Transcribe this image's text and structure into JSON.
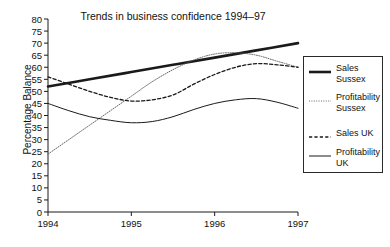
{
  "chart_data": {
    "type": "line",
    "title": "Trends in business confidence 1994–97",
    "xlabel": "",
    "ylabel": "Percentage Balance",
    "x": [
      1994,
      1995,
      1996,
      1997
    ],
    "xticks": [
      "1994",
      "1995",
      "1996",
      "1997"
    ],
    "xlim": [
      1994,
      1997
    ],
    "ylim": [
      0,
      80
    ],
    "yticks": [
      0,
      5,
      10,
      15,
      20,
      25,
      30,
      35,
      40,
      45,
      50,
      55,
      60,
      65,
      70,
      75,
      80
    ],
    "grid": false,
    "legend_position": "right",
    "series": [
      {
        "name": "Sales Sussex",
        "style": "thick-solid",
        "color": "#1a1a1a",
        "x": [
          1994,
          1994.5,
          1995,
          1995.5,
          1996,
          1996.5,
          1997
        ],
        "values": [
          52,
          55,
          58,
          61,
          64,
          67,
          70
        ]
      },
      {
        "name": "Profitability Sussex",
        "style": "fine-dotted",
        "color": "#555555",
        "x": [
          1994,
          1994.25,
          1994.5,
          1994.75,
          1995,
          1995.25,
          1995.5,
          1995.75,
          1996,
          1996.25,
          1996.5,
          1996.75,
          1997
        ],
        "values": [
          24,
          30,
          36,
          42,
          48,
          54,
          59,
          63,
          65.5,
          66,
          65,
          62.5,
          60
        ]
      },
      {
        "name": "Sales UK",
        "style": "dashed",
        "color": "#1a1a1a",
        "x": [
          1994,
          1994.25,
          1994.5,
          1994.75,
          1995,
          1995.25,
          1995.5,
          1995.75,
          1996,
          1996.25,
          1996.5,
          1996.75,
          1997
        ],
        "values": [
          56,
          53,
          50,
          47.5,
          46,
          46.5,
          48.5,
          53,
          57,
          60,
          61.5,
          61,
          60
        ]
      },
      {
        "name": "Profitability UK",
        "style": "thin-solid",
        "color": "#1a1a1a",
        "x": [
          1994,
          1994.25,
          1994.5,
          1994.75,
          1995,
          1995.25,
          1995.5,
          1995.75,
          1996,
          1996.25,
          1996.5,
          1996.75,
          1997
        ],
        "values": [
          45,
          42,
          39.5,
          38,
          37,
          37.5,
          39.5,
          42.5,
          45,
          46.5,
          47,
          45.5,
          43
        ]
      }
    ]
  },
  "legend": {
    "items": [
      {
        "label_line1": "Sales",
        "label_line2": "Sussex"
      },
      {
        "label_line1": "Profitability",
        "label_line2": "Sussex"
      },
      {
        "label_line1": "Sales UK",
        "label_line2": ""
      },
      {
        "label_line1": "Profitability",
        "label_line2": "UK"
      }
    ]
  }
}
